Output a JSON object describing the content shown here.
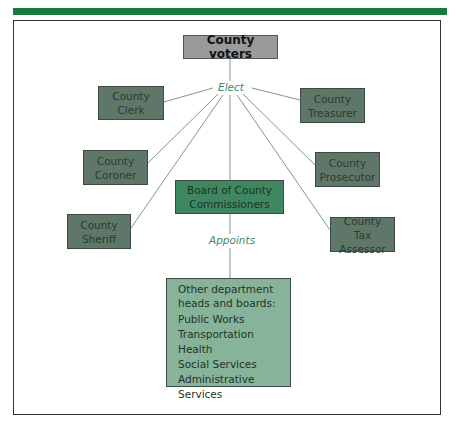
{
  "colors": {
    "top_bar": "#1a7a3e",
    "voters_fill": "#9a9a9a",
    "office_fill": "#5f7768",
    "board_fill": "#3f8760",
    "other_fill": "#86b399",
    "label_text": "#3f8a5f"
  },
  "diagram": {
    "root": {
      "label": "County voters"
    },
    "elect_label": "Elect",
    "appoints_label": "Appoints",
    "elected_offices": [
      {
        "line1": "County",
        "line2": "Clerk"
      },
      {
        "line1": "County",
        "line2": "Treasurer"
      },
      {
        "line1": "County",
        "line2": "Coroner"
      },
      {
        "line1": "County",
        "line2": "Prosecutor"
      },
      {
        "line1": "County",
        "line2": "Sheriff"
      },
      {
        "line1": "County",
        "line2": "Tax Assessor"
      }
    ],
    "board": {
      "line1": "Board of County",
      "line2": "Commissioners"
    },
    "appointed": {
      "header_line1": "Other department",
      "header_line2": "heads and boards:",
      "items": [
        "Public Works",
        "Transportation",
        "Health",
        "Social Services",
        "Administrative Services"
      ]
    }
  }
}
